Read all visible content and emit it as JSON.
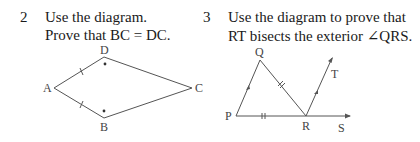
{
  "problems": [
    {
      "number": "2",
      "lines": [
        "Use the diagram.",
        "Prove that BC = DC."
      ],
      "diagram": {
        "labels": {
          "A": "A",
          "B": "B",
          "C": "C",
          "D": "D"
        }
      }
    },
    {
      "number": "3",
      "lines": [
        "Use the diagram to prove that",
        "RT bisects the exterior ∠QRS."
      ],
      "diagram": {
        "labels": {
          "P": "P",
          "Q": "Q",
          "R": "R",
          "S": "S",
          "T": "T"
        }
      }
    }
  ]
}
